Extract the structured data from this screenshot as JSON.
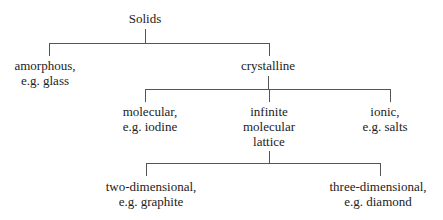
{
  "diagram": {
    "root": {
      "label": "Solids"
    },
    "level1": [
      {
        "line1": "amorphous,",
        "line2": "e.g. glass"
      },
      {
        "line1": "crystalline"
      }
    ],
    "level2": [
      {
        "line1": "molecular,",
        "line2": "e.g. iodine"
      },
      {
        "line1": "infinite",
        "line2": "molecular",
        "line3": "lattice"
      },
      {
        "line1": "ionic,",
        "line2": "e.g. salts"
      }
    ],
    "level3": [
      {
        "line1": "two-dimensional,",
        "line2": "e.g. graphite"
      },
      {
        "line1": "three-dimensional,",
        "line2": "e.g. diamond"
      }
    ]
  }
}
